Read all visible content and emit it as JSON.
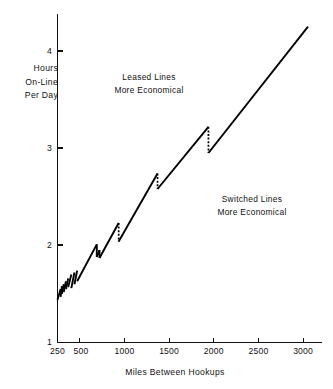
{
  "chart_data": {
    "type": "line",
    "title": "",
    "xlabel": "Miles Between Hookups",
    "ylabel": "Hours On-Line Per Day",
    "ylabel_lines": [
      "Hours",
      "On-Line",
      "Per Day"
    ],
    "xlim": [
      250,
      3060
    ],
    "ylim": [
      1,
      4.4
    ],
    "grid": false,
    "legend": null,
    "xticks": [
      250,
      500,
      1000,
      1500,
      2000,
      2500,
      3000
    ],
    "xtick_labels": [
      "250",
      "500",
      "1000",
      "1500",
      "2000",
      "2500",
      "3000"
    ],
    "yticks": [
      1,
      2,
      3,
      4
    ],
    "ytick_labels": [
      "1",
      "2",
      "3",
      "4"
    ],
    "annotations": [
      {
        "id": "leased",
        "lines": [
          "Leased Lines",
          "More Economical"
        ],
        "x_miles": 1020,
        "y_hours": 3.78
      },
      {
        "id": "switched",
        "lines": [
          "Switched Lines",
          "More Economical"
        ],
        "x_miles": 2230,
        "y_hours": 2.42
      }
    ],
    "series": [
      {
        "name": "Breakeven Hours On-Line Per Day",
        "description": "Sawtooth breakeven curve: rising ramps separated by vertical downward discontinuities",
        "segments": [
          {
            "x": [
              250,
              285
            ],
            "y": [
              1.44,
              1.55
            ]
          },
          {
            "x": [
              285,
              300
            ],
            "y": [
              1.47,
              1.58
            ]
          },
          {
            "x": [
              300,
              320
            ],
            "y": [
              1.5,
              1.6
            ]
          },
          {
            "x": [
              320,
              345
            ],
            "y": [
              1.52,
              1.63
            ]
          },
          {
            "x": [
              345,
              370
            ],
            "y": [
              1.55,
              1.66
            ]
          },
          {
            "x": [
              370,
              405
            ],
            "y": [
              1.57,
              1.7
            ]
          },
          {
            "x": [
              405,
              440
            ],
            "y": [
              1.56,
              1.72
            ]
          },
          {
            "x": [
              440,
              470
            ],
            "y": [
              1.6,
              1.74
            ]
          },
          {
            "x": [
              470,
              690
            ],
            "y": [
              1.63,
              2.01
            ]
          },
          {
            "x": [
              690,
              720
            ],
            "y": [
              1.88,
              1.95
            ]
          },
          {
            "x": [
              720,
              935
            ],
            "y": [
              1.87,
              2.23
            ]
          },
          {
            "x": [
              935,
              1370
            ],
            "y": [
              2.04,
              2.74
            ]
          },
          {
            "x": [
              1370,
              1940
            ],
            "y": [
              2.58,
              3.22
            ]
          },
          {
            "x": [
              1940,
              3055
            ],
            "y": [
              2.95,
              4.25
            ]
          }
        ],
        "drops": [
          {
            "x_miles": 690,
            "y_top": 2.01,
            "y_bottom": 1.88,
            "style": "solid"
          },
          {
            "x_miles": 720,
            "y_top": 1.95,
            "y_bottom": 1.87,
            "style": "solid"
          },
          {
            "x_miles": 935,
            "y_top": 2.23,
            "y_bottom": 2.04,
            "style": "dashed"
          },
          {
            "x_miles": 1370,
            "y_top": 2.74,
            "y_bottom": 2.58,
            "style": "dashed"
          },
          {
            "x_miles": 1940,
            "y_top": 3.22,
            "y_bottom": 2.95,
            "style": "dashed"
          }
        ]
      }
    ]
  },
  "figure": {
    "background_color": "#ffffff",
    "line_color": "#000000",
    "axis_color": "#111111"
  }
}
